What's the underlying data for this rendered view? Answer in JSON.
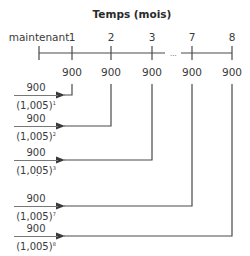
{
  "title": "Temps (mois)",
  "timeline": {
    "labels": [
      {
        "text": "maintenant",
        "x": 39
      },
      {
        "text": "1",
        "x": 72
      },
      {
        "text": "2",
        "x": 111
      },
      {
        "text": "3",
        "x": 152
      },
      {
        "text": "7",
        "x": 192
      },
      {
        "text": "8",
        "x": 232
      }
    ],
    "ellipsis": "...",
    "payments": [
      "900",
      "900",
      "900",
      "900",
      "900"
    ]
  },
  "present_values": [
    {
      "numerator": "900",
      "base": "(1,005)",
      "exponent": "1"
    },
    {
      "numerator": "900",
      "base": "(1,005)",
      "exponent": "2"
    },
    {
      "numerator": "900",
      "base": "(1,005)",
      "exponent": "3"
    },
    {
      "numerator": "900",
      "base": "(1,005)",
      "exponent": "7"
    },
    {
      "numerator": "900",
      "base": "(1,005)",
      "exponent": "8"
    }
  ],
  "vertical_ellipsis": "⋮",
  "colors": {
    "line": "#4a4a4a",
    "text": "#3a3a3a"
  }
}
